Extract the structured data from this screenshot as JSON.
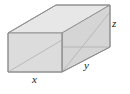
{
  "figure": {
    "canvas": {
      "width": 130,
      "height": 94,
      "background": "#ffffff"
    },
    "colors": {
      "front_face_fill": "#dcdcdc",
      "top_face_fill": "#e7e7e7",
      "right_face_fill": "#d5d5d5",
      "edge_stroke": "#8c8c8c",
      "interior_stroke": "#b0b0b0",
      "label_color": "#1a1a1a"
    },
    "labels": [
      {
        "key": "x",
        "text": "x",
        "meaning": "width-of-front-face",
        "x": 36,
        "y": 80
      },
      {
        "key": "y",
        "text": "y",
        "meaning": "depth-along-oblique-axis",
        "x": 88,
        "y": 66
      },
      {
        "key": "z",
        "text": "z",
        "meaning": "height-of-box",
        "x": 115,
        "y": 24
      }
    ],
    "geometry": {
      "projection": "oblique",
      "depth_offset": {
        "dx": 48,
        "dy": -28
      },
      "front_face": {
        "name": "front-left-face",
        "points": "8,33 62,33 62,72 8,72"
      },
      "top_face": {
        "name": "top-face",
        "points": "8,33 56,5 110,5 62,33"
      },
      "right_face": {
        "name": "right-side-face",
        "points": "62,33 110,5 110,47 62,72"
      },
      "interior_lines": [
        {
          "name": "front-face-diagonal",
          "x1": 8,
          "y1": 72,
          "x2": 62,
          "y2": 40
        },
        {
          "name": "right-face-diagonal",
          "x1": 62,
          "y1": 72,
          "x2": 110,
          "y2": 12
        },
        {
          "name": "right-face-horizontal",
          "x1": 62,
          "y1": 47,
          "x2": 110,
          "y2": 47
        }
      ],
      "outline": "8,33 56,5 110,5 110,47 62,72 8,72"
    }
  }
}
